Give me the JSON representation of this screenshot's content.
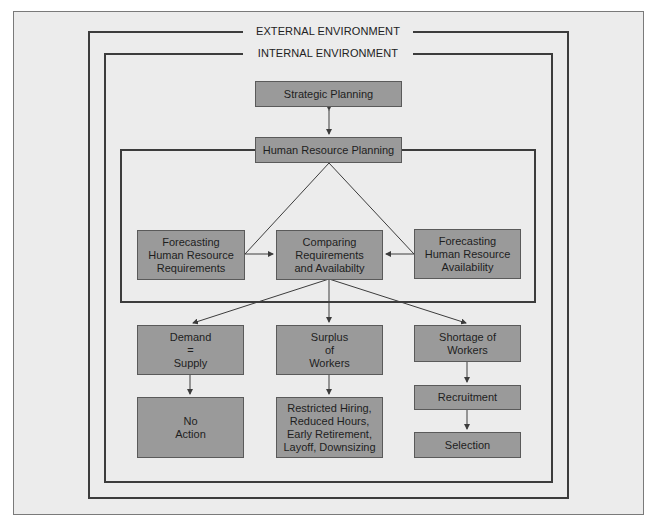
{
  "frames": {
    "external_label": "EXTERNAL ENVIRONMENT",
    "internal_label": "INTERNAL ENVIRONMENT"
  },
  "nodes": {
    "strategic_planning": "Strategic Planning",
    "hr_planning": "Human Resource Planning",
    "forecast_requirements": "Forecasting\nHuman Resource\nRequirements",
    "comparing": "Comparing\nRequirements\nand Availabilty",
    "forecast_availability": "Forecasting\nHuman Resource\nAvailability",
    "demand_supply": "Demand\n=\nSupply",
    "surplus": "Surplus\nof\nWorkers",
    "shortage": "Shortage of\nWorkers",
    "no_action": "No\nAction",
    "surplus_actions": "Restricted Hiring,\nReduced Hours,\nEarly Retirement,\nLayoff, Downsizing",
    "recruitment": "Recruitment",
    "selection": "Selection"
  },
  "colors": {
    "background": "#ececec",
    "box_fill": "#9a9a9a",
    "line": "#3c3c3c"
  }
}
